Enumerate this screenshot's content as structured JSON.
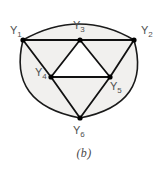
{
  "figure": {
    "caption": "(b)",
    "caption_top_px": 146,
    "shape": {
      "name": "rounded-triangle-outline",
      "fill_color": "#f1f0ee",
      "stroke_color": "#1a1a1a",
      "stroke_width": 1.6
    },
    "graph": {
      "stroke_color": "#111111",
      "edge_width": 1.8,
      "node_color": "#000000",
      "node_radius": 2.6,
      "nodes": [
        {
          "id": "Y1",
          "label": "Y",
          "sub": "1",
          "x": 23,
          "y": 40,
          "label_x": 10,
          "label_y": 34,
          "sub_dx": 7,
          "sub_dy": 3
        },
        {
          "id": "Y2",
          "label": "Y",
          "sub": "2",
          "x": 134,
          "y": 40,
          "label_x": 141,
          "label_y": 34,
          "sub_dx": 7,
          "sub_dy": 3
        },
        {
          "id": "Y3",
          "label": "Y",
          "sub": "3",
          "x": 80,
          "y": 40,
          "label_x": 73,
          "label_y": 29,
          "sub_dx": 7,
          "sub_dy": 3
        },
        {
          "id": "Y4",
          "label": "Y",
          "sub": "4",
          "x": 51,
          "y": 77,
          "label_x": 35,
          "label_y": 76,
          "sub_dx": 7,
          "sub_dy": 3
        },
        {
          "id": "Y5",
          "label": "Y",
          "sub": "5",
          "x": 110,
          "y": 77,
          "label_x": 110,
          "label_y": 90,
          "sub_dx": 7,
          "sub_dy": 3
        },
        {
          "id": "Y6",
          "label": "Y",
          "sub": "6",
          "x": 80,
          "y": 118,
          "label_x": 73,
          "label_y": 134,
          "sub_dx": 7,
          "sub_dy": 3
        }
      ],
      "edges": [
        {
          "from": "Y1",
          "to": "Y3"
        },
        {
          "from": "Y3",
          "to": "Y2"
        },
        {
          "from": "Y1",
          "to": "Y4"
        },
        {
          "from": "Y4",
          "to": "Y6"
        },
        {
          "from": "Y2",
          "to": "Y5"
        },
        {
          "from": "Y5",
          "to": "Y6"
        },
        {
          "from": "Y3",
          "to": "Y4"
        },
        {
          "from": "Y3",
          "to": "Y5"
        },
        {
          "from": "Y4",
          "to": "Y5"
        }
      ],
      "outer_boundary_path": "M 23 40 Q 80 8 134 40 Q 152 104 80 118 Q 7 104 23 40 Z",
      "inner_triangle_path": "M 80 40 L 51 77 L 110 77 Z",
      "inner_triangle_fill": "#ffffff"
    }
  }
}
